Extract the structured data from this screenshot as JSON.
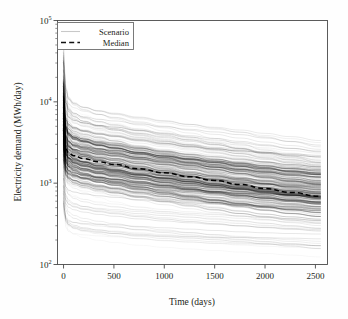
{
  "chart_data": {
    "type": "line",
    "title": "",
    "xlabel": "Time (days)",
    "ylabel": "Electricity demand (MWh/day)",
    "xlim": [
      -60,
      2620
    ],
    "ylim": [
      100,
      100000
    ],
    "yscale": "log",
    "xscale": "linear",
    "grid": false,
    "xticks": [
      0,
      500,
      1000,
      1500,
      2000,
      2500
    ],
    "xticklabels": [
      "0",
      "500",
      "1000",
      "1500",
      "2000",
      "2500"
    ],
    "yticks": [
      100,
      1000,
      10000,
      100000
    ],
    "yticklabels": [
      "10^2",
      "10^3",
      "10^4",
      "10^5"
    ],
    "ytick_base": "10",
    "ytick_exponents": [
      "2",
      "3",
      "4",
      "5"
    ],
    "legend_position": "upper left",
    "series": [
      {
        "name": "Scenario",
        "style": "solid",
        "color": "#000000",
        "alpha": 0.18,
        "count": 220,
        "description": "Ensemble of decaying electricity-demand trajectories, each starting between ~180 and ~35000 MWh/day at day 0 and decaying to between ~120 and ~2000 MWh/day at day 2550.",
        "x": [
          0,
          10,
          25,
          50,
          100,
          200,
          350,
          500,
          750,
          1000,
          1250,
          1500,
          1750,
          2000,
          2250,
          2550
        ],
        "envelope_upper": [
          35000,
          22000,
          15000,
          12000,
          10500,
          9200,
          8200,
          7400,
          6400,
          5600,
          4900,
          4300,
          3800,
          3300,
          2900,
          2500
        ],
        "envelope_lower": [
          300,
          250,
          220,
          205,
          195,
          185,
          178,
          172,
          163,
          156,
          150,
          144,
          138,
          133,
          128,
          123
        ],
        "dense_band_upper": [
          9000,
          6500,
          5200,
          4600,
          4200,
          3850,
          3500,
          3250,
          2850,
          2520,
          2250,
          2020,
          1820,
          1640,
          1480,
          1350
        ],
        "dense_band_lower": [
          1500,
          1300,
          1180,
          1100,
          1030,
          950,
          870,
          810,
          730,
          670,
          620,
          578,
          540,
          508,
          480,
          455
        ]
      },
      {
        "name": "Median",
        "style": "dashed",
        "color": "#000000",
        "alpha": 1.0,
        "x": [
          0,
          10,
          25,
          50,
          100,
          200,
          350,
          500,
          750,
          1000,
          1250,
          1500,
          1750,
          2000,
          2250,
          2550
        ],
        "y": [
          4200,
          3100,
          2600,
          2350,
          2180,
          2000,
          1830,
          1700,
          1500,
          1340,
          1200,
          1080,
          965,
          860,
          770,
          690
        ]
      }
    ]
  },
  "axes": {
    "x_title": "Time (days)",
    "y_title": "Electricity demand (MWh/day)"
  },
  "legend": {
    "items": [
      {
        "label": "Scenario",
        "style": "solid",
        "color": "#c8c8c8"
      },
      {
        "label": "Median",
        "style": "dashed",
        "color": "#111111"
      }
    ]
  },
  "colors": {
    "background": "#fefefe",
    "axis": "#4a4a4a",
    "text": "#231f20",
    "scenario_line": "#000000",
    "median_line": "#000000",
    "legend_border": "#6d6d6d"
  }
}
